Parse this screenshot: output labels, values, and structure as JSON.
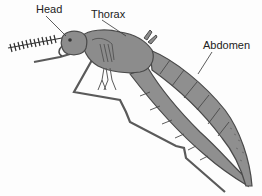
{
  "diagram": {
    "labels": [
      {
        "id": "head",
        "text": "Head"
      },
      {
        "id": "thorax",
        "text": "Thorax"
      },
      {
        "id": "abdomen",
        "text": "Abdomen"
      }
    ],
    "colors": {
      "body_fill": "#8c8c8c",
      "body_stroke": "#4a4a4a",
      "outline": "#555555",
      "background": "#fdfdfd",
      "label_text": "#222222"
    }
  }
}
